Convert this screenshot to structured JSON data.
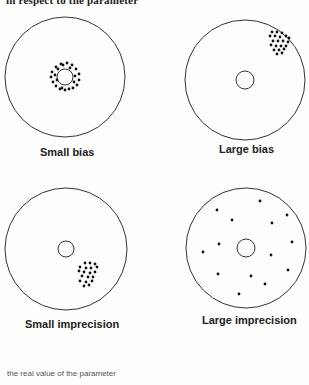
{
  "header": {
    "clipped_text": "in respect to the parameter"
  },
  "panels": [
    {
      "label": "Small bias",
      "target": {
        "cx": 65,
        "cy": 77,
        "r": 60,
        "inner_r": 8
      },
      "dots": [
        [
          61,
          64
        ],
        [
          67,
          63
        ],
        [
          72,
          65
        ],
        [
          56,
          67
        ],
        [
          76,
          69
        ],
        [
          52,
          72
        ],
        [
          79,
          74
        ],
        [
          51,
          77
        ],
        [
          79,
          80
        ],
        [
          53,
          82
        ],
        [
          77,
          85
        ],
        [
          56,
          86
        ],
        [
          73,
          88
        ],
        [
          60,
          89
        ],
        [
          65,
          90
        ],
        [
          69,
          89
        ],
        [
          58,
          69
        ],
        [
          70,
          68
        ],
        [
          55,
          75
        ],
        [
          75,
          76
        ],
        [
          57,
          80
        ],
        [
          63,
          65
        ],
        [
          74,
          82
        ],
        [
          62,
          88
        ]
      ]
    },
    {
      "label": "Large bias",
      "target": {
        "cx": 245,
        "cy": 80,
        "r": 60,
        "inner_r": 9
      },
      "dots": [
        [
          272,
          32
        ],
        [
          277,
          32
        ],
        [
          282,
          33
        ],
        [
          270,
          36
        ],
        [
          275,
          36
        ],
        [
          280,
          37
        ],
        [
          286,
          36
        ],
        [
          289,
          38
        ],
        [
          273,
          41
        ],
        [
          278,
          41
        ],
        [
          283,
          41
        ],
        [
          288,
          42
        ],
        [
          271,
          45
        ],
        [
          276,
          46
        ],
        [
          281,
          46
        ],
        [
          286,
          46
        ],
        [
          274,
          50
        ],
        [
          279,
          50
        ],
        [
          284,
          49
        ],
        [
          277,
          54
        ],
        [
          282,
          53
        ]
      ]
    },
    {
      "label": "Small imprecision",
      "target": {
        "cx": 66,
        "cy": 249,
        "r": 61,
        "inner_r": 8
      },
      "dots": [
        [
          85,
          263
        ],
        [
          90,
          263
        ],
        [
          95,
          264
        ],
        [
          80,
          267
        ],
        [
          86,
          268
        ],
        [
          91,
          268
        ],
        [
          97,
          267
        ],
        [
          79,
          271
        ],
        [
          84,
          272
        ],
        [
          90,
          273
        ],
        [
          95,
          272
        ],
        [
          82,
          276
        ],
        [
          88,
          277
        ],
        [
          93,
          277
        ],
        [
          80,
          281
        ],
        [
          86,
          282
        ],
        [
          92,
          281
        ],
        [
          84,
          286
        ],
        [
          89,
          285
        ]
      ]
    },
    {
      "label": "Large imprecision",
      "target": {
        "cx": 246,
        "cy": 248,
        "r": 60,
        "inner_r": 9
      },
      "dots": [
        [
          260,
          201
        ],
        [
          217,
          210
        ],
        [
          287,
          215
        ],
        [
          232,
          220
        ],
        [
          272,
          223
        ],
        [
          292,
          242
        ],
        [
          219,
          244
        ],
        [
          203,
          252
        ],
        [
          271,
          255
        ],
        [
          288,
          270
        ],
        [
          218,
          274
        ],
        [
          251,
          276
        ],
        [
          265,
          284
        ],
        [
          239,
          294
        ]
      ]
    }
  ],
  "caption": "the real value of the parameter",
  "colors": {
    "line": "#333333",
    "dot": "#111111",
    "background": "#fdfdfb"
  }
}
